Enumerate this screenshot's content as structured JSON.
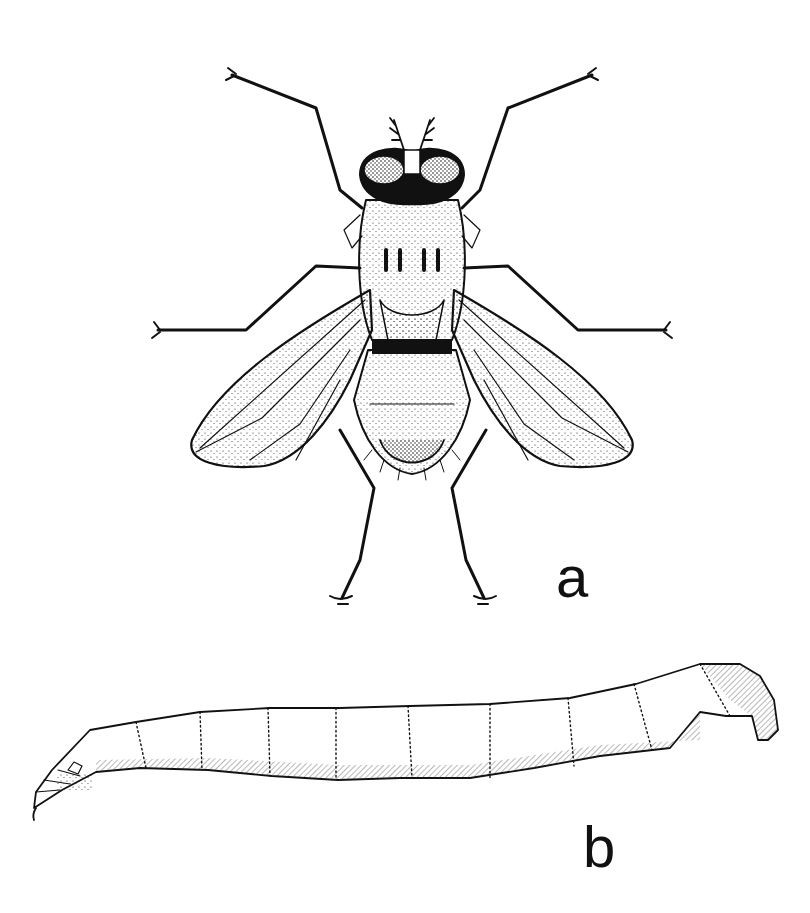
{
  "figure": {
    "panels": [
      {
        "id": "a",
        "label": "a",
        "subject": "adult fly, dorsal view"
      },
      {
        "id": "b",
        "label": "b",
        "subject": "larva, lateral view"
      }
    ],
    "colors": {
      "ink": "#111111",
      "background": "#ffffff"
    }
  }
}
